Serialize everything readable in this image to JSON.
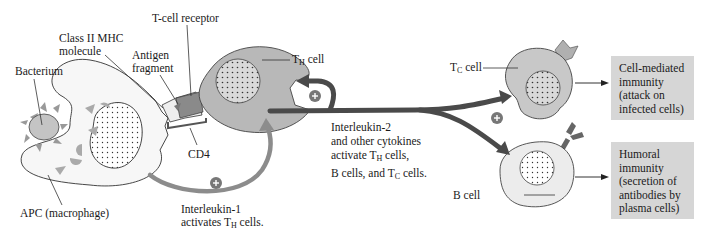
{
  "diagram": {
    "labels": {
      "t_cell_receptor": "T-cell receptor",
      "class_ii_mhc_line1": "Class II MHC",
      "class_ii_mhc_line2": "molecule",
      "antigen_line1": "Antigen",
      "antigen_line2": "fragment",
      "bacterium": "Bacterium",
      "cd4": "CD4",
      "apc": "APC (macrophage)",
      "th_cell_main": "T",
      "th_cell_sub": "H",
      "th_cell_suffix": " cell",
      "tc_cell_main": "T",
      "tc_cell_sub": "C",
      "tc_cell_suffix": " cell",
      "b_cell": "B cell",
      "il1_line1": "Interleukin-1",
      "il1_line2_pre": "activates T",
      "il1_line2_sub": "H",
      "il1_line2_post": " cells.",
      "il2_line1": "Interleukin-2",
      "il2_line2": "and other cytokines",
      "il2_line3_pre": "activate T",
      "il2_line3_sub": "H",
      "il2_line3_post": " cells,",
      "il2_line4_pre": "B cells, and T",
      "il2_line4_sub": "C",
      "il2_line4_post": " cells."
    },
    "outcomes": [
      {
        "lines": [
          "Cell-mediated",
          "immunity",
          "(attack on",
          "infected cells)"
        ]
      },
      {
        "lines": [
          "Humoral",
          "immunity",
          "(secretion of",
          "antibodies by",
          "plasma cells)"
        ]
      }
    ],
    "plus_symbol": "+",
    "colors": {
      "cell_fill": "#b8b8b8",
      "tc_fill": "#c8c8c8",
      "b_fill": "#ececec",
      "apc_fill": "#f7f7f7",
      "arrow_dark": "#4a4a4a",
      "arrow_light": "#8c8c8c",
      "outcome_box": "#d6d6d6"
    }
  }
}
